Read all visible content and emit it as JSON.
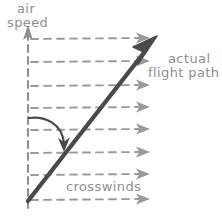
{
  "diagram": {
    "style": "hand-drawn sketch",
    "background_color": "#ffffff"
  },
  "axis": {
    "name": "air-speed-axis",
    "label_line1": "air",
    "label_line2": "speed",
    "color": "#8f8f8f",
    "orientation": "vertical",
    "line_style": "dashed",
    "arrow_head": "top"
  },
  "flight_path": {
    "name": "actual-flight-path-arrow",
    "label_line1": "actual",
    "label_line2": "flight path",
    "color": "#4a4a4a",
    "direction": "up-right",
    "start": [
      28,
      200
    ],
    "end": [
      156,
      38
    ]
  },
  "crosswinds": {
    "name": "crosswind-arrows",
    "label": "crosswinds",
    "color": "#9a9a9a",
    "line_style": "dashed",
    "direction": "left-to-right",
    "count": 8,
    "rows_y": [
      39,
      62,
      86,
      108,
      130,
      153,
      175,
      200
    ],
    "x_start": 30,
    "x_end": 150
  },
  "angle_indicator": {
    "name": "drift-angle-curved-arrow",
    "color": "#4a4a4a",
    "from": [
      29,
      118
    ],
    "to": [
      64,
      149
    ]
  }
}
